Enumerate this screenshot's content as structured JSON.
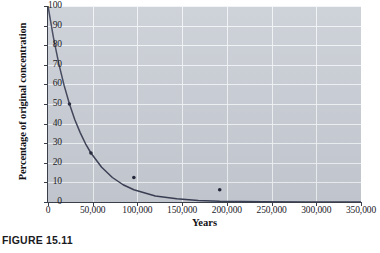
{
  "figure": {
    "caption": "FIGURE 15.11"
  },
  "chart_data": {
    "type": "line",
    "title": "",
    "xlabel": "Years",
    "ylabel": "Percentage of original concentration",
    "xlim": [
      0,
      350000
    ],
    "ylim": [
      0,
      100
    ],
    "grid": true,
    "legend": "none",
    "x_ticks": [
      0,
      50000,
      100000,
      150000,
      200000,
      250000,
      300000,
      350000
    ],
    "x_tick_labels": [
      "0",
      "50,000",
      "100,000",
      "150,000",
      "200,000",
      "250,000",
      "300,000",
      "350,000"
    ],
    "y_ticks": [
      0,
      10,
      20,
      30,
      40,
      50,
      60,
      70,
      80,
      90,
      100
    ],
    "y_tick_labels": [
      "0",
      "10",
      "20",
      "30",
      "40",
      "50",
      "60",
      "70",
      "80",
      "90",
      "100"
    ],
    "half_life_years": 24000,
    "series": [
      {
        "name": "Percentage of original concentration",
        "color": "#3a3f55",
        "x": [
          0,
          6000,
          12000,
          18000,
          24000,
          30000,
          36000,
          42000,
          48000,
          60000,
          72000,
          84000,
          96000,
          120000,
          144000,
          168000,
          192000,
          240000,
          288000,
          350000
        ],
        "y": [
          100,
          84.1,
          70.7,
          59.5,
          50,
          42.0,
          35.4,
          29.7,
          25,
          17.7,
          12.5,
          8.8,
          6.25,
          3.1,
          1.6,
          0.8,
          0.4,
          0.1,
          0.03,
          0.01
        ]
      }
    ],
    "markers": [
      {
        "x": 24000,
        "y": 50,
        "label": "1 half-life"
      },
      {
        "x": 48000,
        "y": 25,
        "label": "2 half-lives"
      },
      {
        "x": 96000,
        "y": 12.5,
        "label": "3 half-lives"
      },
      {
        "x": 192000,
        "y": 6.25,
        "label": "4 half-lives"
      }
    ],
    "colors": {
      "plot_background": "#c9cdd5",
      "gridline": "#f2f4f7",
      "axis": "#3b3f49",
      "curve": "#3a3f55",
      "page_background": "#ffffff"
    }
  }
}
